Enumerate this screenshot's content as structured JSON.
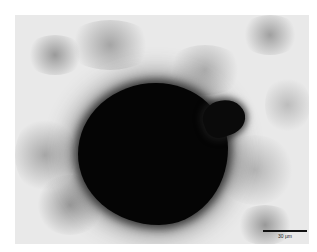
{
  "image": {
    "description": "Brightfield micrograph of a dense dark spheroid surrounded by scattered granular material",
    "background_color": "#e9e9e9",
    "object_color": "#050505"
  },
  "scale_bar": {
    "label": "30 µm",
    "color": "#111111"
  }
}
